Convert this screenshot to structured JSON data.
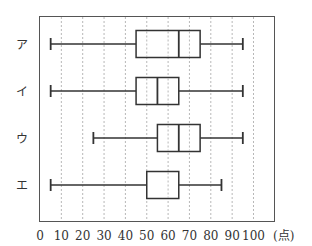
{
  "chart_data": {
    "type": "boxplot",
    "title": "",
    "xlabel": "(点)",
    "ylabel": "",
    "xlim": [
      0,
      100
    ],
    "xticks": [
      0,
      10,
      20,
      30,
      40,
      50,
      60,
      70,
      80,
      90,
      100
    ],
    "grid": "vertical dashed at every 10",
    "categories": [
      "ア",
      "イ",
      "ウ",
      "エ"
    ],
    "series": [
      {
        "name": "ア",
        "min": 5,
        "q1": 45,
        "median": 65,
        "q3": 75,
        "max": 95
      },
      {
        "name": "イ",
        "min": 5,
        "q1": 45,
        "median": 55,
        "q3": 65,
        "max": 95
      },
      {
        "name": "ウ",
        "min": 25,
        "q1": 55,
        "median": 65,
        "q3": 75,
        "max": 95
      },
      {
        "name": "エ",
        "min": 5,
        "q1": 50,
        "median": 65,
        "q3": 65,
        "max": 85
      }
    ]
  },
  "axis": {
    "unit_label": "(点)"
  },
  "colors": {
    "line": "#333333",
    "grid": "#999999",
    "frame": "#555555"
  }
}
